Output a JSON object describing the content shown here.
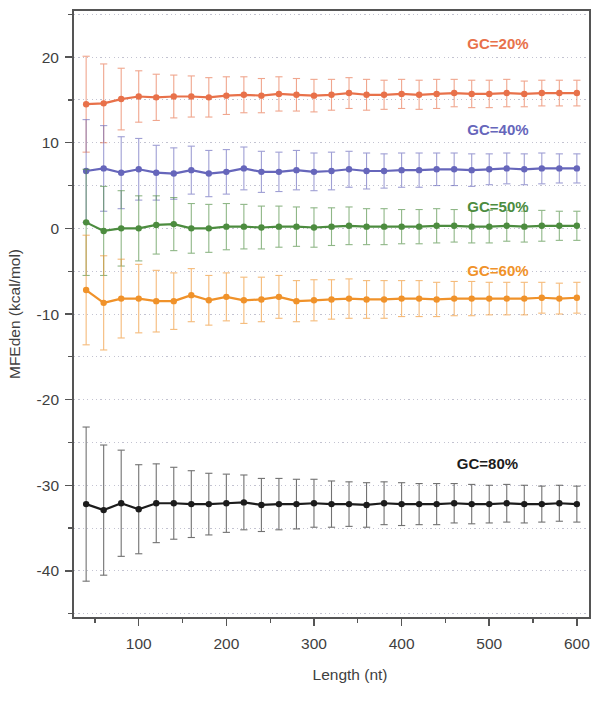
{
  "chart_data": {
    "type": "line",
    "title": "",
    "subtitle": "",
    "xlabel": "Length (nt)",
    "ylabel": "MFEden (kcal/mol)",
    "xlim": [
      25,
      615
    ],
    "ylim": [
      -45.5,
      25.5
    ],
    "x_major_ticks": [
      100,
      200,
      300,
      400,
      500,
      600
    ],
    "x_major_tick_labels": [
      "100",
      "200",
      "300",
      "400",
      "500",
      "600"
    ],
    "x_minor_ticks": [
      50,
      150,
      250,
      350,
      450,
      550
    ],
    "y_major_ticks": [
      20,
      10,
      0,
      -10,
      -20,
      -30,
      -40
    ],
    "y_major_tick_labels": [
      "20",
      "10",
      "0",
      "-10",
      "-20",
      "-30",
      "-40"
    ],
    "y_minor_ticks": [
      25,
      15,
      5,
      -5,
      -15,
      -25,
      -35,
      -45
    ],
    "grid": "dotted-minor-and-major",
    "legend_position": "inline-right",
    "error_bars": "symmetric-std-dev",
    "x": [
      40,
      60,
      80,
      100,
      120,
      140,
      160,
      180,
      200,
      220,
      240,
      260,
      280,
      300,
      320,
      340,
      360,
      380,
      400,
      420,
      440,
      460,
      480,
      500,
      520,
      540,
      560,
      580,
      600
    ],
    "series": [
      {
        "name": "GC=20%",
        "label": "GC=20%",
        "color": "#E8714A",
        "label_x": 510,
        "label_y": 21.5,
        "values": [
          14.5,
          14.6,
          15.1,
          15.4,
          15.3,
          15.4,
          15.4,
          15.3,
          15.5,
          15.6,
          15.5,
          15.7,
          15.6,
          15.5,
          15.6,
          15.8,
          15.6,
          15.6,
          15.7,
          15.6,
          15.7,
          15.8,
          15.7,
          15.7,
          15.8,
          15.7,
          15.8,
          15.8,
          15.8
        ],
        "errors": [
          5.6,
          4.6,
          3.6,
          3.0,
          2.7,
          2.5,
          2.4,
          2.3,
          2.2,
          2.1,
          2.0,
          2.0,
          1.9,
          1.9,
          1.8,
          1.8,
          1.8,
          1.7,
          1.7,
          1.7,
          1.7,
          1.6,
          1.6,
          1.6,
          1.6,
          1.5,
          1.5,
          1.5,
          1.5
        ]
      },
      {
        "name": "GC=40%",
        "label": "GC=40%",
        "color": "#6666BB",
        "label_x": 510,
        "label_y": 11.5,
        "values": [
          6.7,
          7.0,
          6.5,
          6.9,
          6.5,
          6.4,
          6.8,
          6.4,
          6.6,
          7.0,
          6.6,
          6.6,
          6.8,
          6.6,
          6.7,
          6.9,
          6.7,
          6.7,
          6.8,
          6.8,
          6.9,
          6.9,
          6.8,
          6.9,
          7.0,
          6.9,
          7.0,
          7.0,
          7.0
        ],
        "errors": [
          6.0,
          5.0,
          4.2,
          3.6,
          3.2,
          3.0,
          2.8,
          2.7,
          2.6,
          2.5,
          2.4,
          2.3,
          2.3,
          2.2,
          2.2,
          2.1,
          2.1,
          2.0,
          2.0,
          2.0,
          1.9,
          1.9,
          1.9,
          1.8,
          1.8,
          1.8,
          1.8,
          1.7,
          1.7
        ]
      },
      {
        "name": "GC=50%",
        "label": "GC=50%",
        "color": "#4C8C3F",
        "label_x": 510,
        "label_y": 2.5,
        "values": [
          0.7,
          -0.3,
          0.0,
          0.0,
          0.4,
          0.5,
          0.0,
          0.0,
          0.2,
          0.2,
          0.1,
          0.2,
          0.2,
          0.1,
          0.2,
          0.3,
          0.2,
          0.2,
          0.2,
          0.2,
          0.3,
          0.3,
          0.2,
          0.2,
          0.3,
          0.2,
          0.3,
          0.3,
          0.3
        ],
        "errors": [
          6.2,
          5.2,
          4.4,
          3.8,
          3.4,
          3.1,
          2.9,
          2.8,
          2.7,
          2.6,
          2.5,
          2.4,
          2.3,
          2.3,
          2.2,
          2.2,
          2.1,
          2.1,
          2.0,
          2.0,
          2.0,
          1.9,
          1.9,
          1.9,
          1.8,
          1.8,
          1.8,
          1.7,
          1.7
        ]
      },
      {
        "name": "GC=60%",
        "label": "GC=60%",
        "color": "#F0922A",
        "label_x": 510,
        "label_y": -5.0,
        "values": [
          -7.2,
          -8.7,
          -8.2,
          -8.2,
          -8.5,
          -8.5,
          -7.8,
          -8.4,
          -8.0,
          -8.4,
          -8.3,
          -8.0,
          -8.5,
          -8.4,
          -8.3,
          -8.2,
          -8.3,
          -8.3,
          -8.2,
          -8.2,
          -8.3,
          -8.2,
          -8.2,
          -8.2,
          -8.2,
          -8.2,
          -8.1,
          -8.2,
          -8.1
        ],
        "errors": [
          6.4,
          5.5,
          4.6,
          4.0,
          3.6,
          3.3,
          3.1,
          2.9,
          2.8,
          2.7,
          2.6,
          2.5,
          2.4,
          2.4,
          2.3,
          2.3,
          2.2,
          2.2,
          2.1,
          2.1,
          2.0,
          2.0,
          2.0,
          1.9,
          1.9,
          1.9,
          1.8,
          1.8,
          1.8
        ]
      },
      {
        "name": "GC=80%",
        "label": "GC=80%",
        "color": "#1C1C1C",
        "label_x": 498,
        "label_y": -27.5,
        "values": [
          -32.2,
          -32.9,
          -32.1,
          -32.8,
          -32.1,
          -32.1,
          -32.2,
          -32.2,
          -32.1,
          -32.0,
          -32.3,
          -32.2,
          -32.2,
          -32.1,
          -32.2,
          -32.2,
          -32.3,
          -32.1,
          -32.2,
          -32.2,
          -32.2,
          -32.1,
          -32.2,
          -32.2,
          -32.1,
          -32.2,
          -32.2,
          -32.1,
          -32.2
        ],
        "errors": [
          9.0,
          7.6,
          6.2,
          5.2,
          4.6,
          4.2,
          3.9,
          3.6,
          3.4,
          3.2,
          3.1,
          3.0,
          2.9,
          2.8,
          2.7,
          2.6,
          2.6,
          2.5,
          2.5,
          2.4,
          2.4,
          2.3,
          2.3,
          2.2,
          2.2,
          2.2,
          2.1,
          2.1,
          2.1
        ]
      }
    ]
  },
  "figure": {
    "background": "#ffffff",
    "frame_color": "#555555",
    "grid_color": "#b9b9c9"
  }
}
